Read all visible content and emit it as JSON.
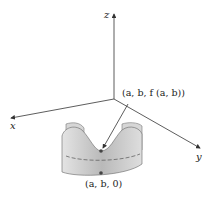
{
  "axes": {
    "x_label": "x",
    "y_label": "y",
    "z_label": "z"
  },
  "points": {
    "surface_point_label": "(a, b, f (a, b))",
    "base_point_label": "(a, b, 0)"
  },
  "colors": {
    "axis": "#333333",
    "surface_fill": "#c8c8c8",
    "surface_edge": "#666666",
    "point": "#444444"
  }
}
